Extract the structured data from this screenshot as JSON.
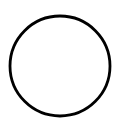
{
  "canvas": {
    "width": 116,
    "height": 127,
    "background": "#ffffff"
  },
  "shape": {
    "type": "circle",
    "cx": 60,
    "cy": 66,
    "r": 50,
    "stroke": "#000000",
    "stroke_width": 2.8,
    "fill": "none"
  }
}
